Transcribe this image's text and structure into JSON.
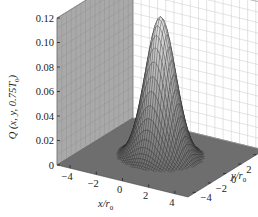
{
  "chart_data": {
    "type": "surface3d",
    "title": "",
    "function": "Gaussian peak Q(x,y) = A*exp(-(x^2+y^2)/(2*sigma^2))",
    "peak_value": 0.115,
    "sigma": 1.0,
    "center": [
      0,
      0
    ],
    "xlabel": "x/r0",
    "ylabel": "y/r0",
    "zlabel": "Q (x, y, 0.75T0)",
    "xlim": [
      -5,
      5
    ],
    "ylim": [
      -5,
      5
    ],
    "zlim": [
      0,
      0.12
    ],
    "x_ticks": [
      -4,
      -2,
      0,
      2,
      4
    ],
    "y_ticks": [
      -4,
      -2,
      0,
      2,
      4
    ],
    "z_ticks": [
      0,
      0.02,
      0.04,
      0.06,
      0.08,
      0.1,
      0.12
    ],
    "z_tick_labels": [
      "0",
      "0.02",
      "0.04",
      "0.06",
      "0.08",
      "0.10",
      "0.12"
    ],
    "grid": true,
    "colormap": "grayscale mesh"
  },
  "labels": {
    "z_axis_main": "Q",
    "z_axis_args": "(x, y, 0.75T",
    "z_axis_sub": "0",
    "z_axis_close": ")",
    "x_axis_main": "x/r",
    "x_axis_sub": "0",
    "y_axis_main": "y/r",
    "y_axis_sub": "0"
  },
  "colors": {
    "left_wall": "#a9a9a9",
    "right_wall": "#ffffff",
    "floor": "#6e6e6e",
    "grid_left": "#8e8e8e",
    "grid_right": "#c8c8c8",
    "mesh": "#222222"
  }
}
